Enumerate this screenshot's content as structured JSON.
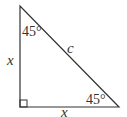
{
  "diagram": {
    "type": "right-triangle",
    "colors": {
      "stroke": "#333333",
      "background": "#ffffff"
    },
    "labels": {
      "top_angle": "45°",
      "bottom_right_angle": "45°",
      "hypotenuse": "c",
      "left_leg": "x",
      "bottom_leg": "x"
    },
    "right_angle_marker": "bottom-left"
  }
}
